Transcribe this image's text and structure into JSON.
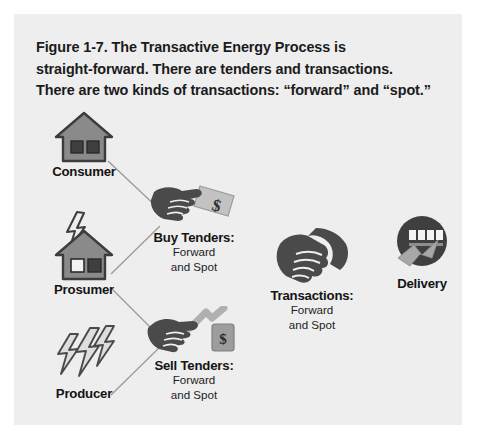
{
  "figure": {
    "caption_lines": [
      "Figure 1-7. The Transactive Energy Process is",
      "straight-forward. There are tenders and transactions.",
      "There are two kinds of transactions: “forward” and “spot.”"
    ],
    "background_color": "#eeeeee",
    "page_color": "#ffffff"
  },
  "palette": {
    "icon_dark": "#4a4a4a",
    "icon_mid": "#8a8a8a",
    "icon_light": "#b6b6b6",
    "icon_outline": "#3c3c3c",
    "text": "#141414",
    "line": "#9a9a9a"
  },
  "nodes": {
    "consumer": {
      "label": "Consumer",
      "icon": "house-icon",
      "sub_lines": []
    },
    "prosumer": {
      "label": "Prosumer",
      "icon": "house-with-lightning-icon",
      "sub_lines": []
    },
    "producer": {
      "label": "Producer",
      "icon": "lightning-bolts-icon",
      "sub_lines": []
    },
    "buy_tenders": {
      "label": "Buy Tenders:",
      "icon": "handshake-with-banknote-icon",
      "sub_lines": [
        "Forward",
        "and Spot"
      ]
    },
    "sell_tenders": {
      "label": "Sell Tenders:",
      "icon": "handshake-with-price-tag-icon",
      "sub_lines": [
        "Forward",
        "and Spot"
      ]
    },
    "transactions": {
      "label": "Transactions:",
      "icon": "handshake-icon",
      "sub_lines": [
        "Forward",
        "and Spot"
      ]
    },
    "delivery": {
      "label": "Delivery",
      "icon": "electric-meter-icon",
      "sub_lines": []
    }
  },
  "icon_text": {
    "dollar_sign": "$"
  }
}
